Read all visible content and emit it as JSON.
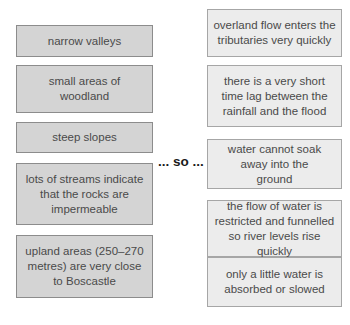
{
  "connector": "... so ...",
  "causes": [
    "narrow valleys",
    "small areas of woodland",
    "steep slopes",
    "lots of streams indicate that the rocks are impermeable",
    "upland areas (250–270 metres) are very close to Boscastle"
  ],
  "effects": [
    "overland flow enters the tributaries very quickly",
    "there is a very short time lag between the rainfall and the flood",
    "water cannot soak away into the ground",
    "the flow of water is restricted and funnelled so river levels rise quickly",
    "only a little water is absorbed or slowed"
  ],
  "colors": {
    "cause_fill": "#d4d4d4",
    "cause_border": "#8c8c8c",
    "effect_fill": "#ececec",
    "effect_border": "#a6a6a6",
    "text": "#4a4a4a"
  }
}
